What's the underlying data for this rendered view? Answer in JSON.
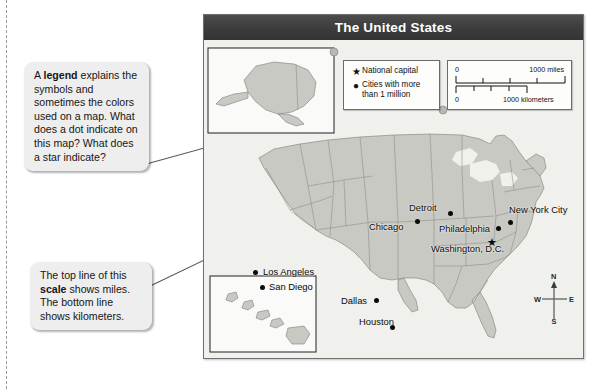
{
  "figure": {
    "title": "The United States"
  },
  "legend": {
    "rows": [
      {
        "symbol": "★",
        "symbol_name": "star-symbol",
        "label": "National capital"
      },
      {
        "symbol": "●",
        "symbol_name": "dot-symbol",
        "label": "Cities with more than 1 million"
      }
    ]
  },
  "scale": {
    "miles": {
      "zero": "0",
      "max": "1000 miles"
    },
    "kilometers": {
      "zero": "0",
      "max": "1000 kilometers"
    }
  },
  "callouts": [
    {
      "id": "legend-callout",
      "lead": "A ",
      "bold": "legend",
      "rest": " explains the symbols and sometimes the colors used on a map. What does a dot indicate on this map? What does a star indicate?"
    },
    {
      "id": "scale-callout",
      "lead": "The top line of this ",
      "bold": "scale",
      "rest": " shows miles. The bottom line shows kilometers."
    }
  ],
  "cities": [
    {
      "name": "Detroit",
      "type": "city"
    },
    {
      "name": "New York City",
      "type": "city"
    },
    {
      "name": "Chicago",
      "type": "city"
    },
    {
      "name": "Philadelphia",
      "type": "city"
    },
    {
      "name": "Washington, D.C.",
      "type": "capital"
    },
    {
      "name": "Los Angeles",
      "type": "city"
    },
    {
      "name": "San Diego",
      "type": "city"
    },
    {
      "name": "Dallas",
      "type": "city"
    },
    {
      "name": "Houston",
      "type": "city"
    }
  ],
  "compass": {
    "north": "N",
    "east": "E",
    "south": "S",
    "west": "W"
  },
  "colors": {
    "title_bar": "#3c3c3c",
    "land": "#c9c9c4",
    "water": "#f0f0ec",
    "border": "#6f6f6f",
    "callout_bg": "#eeeeee"
  }
}
